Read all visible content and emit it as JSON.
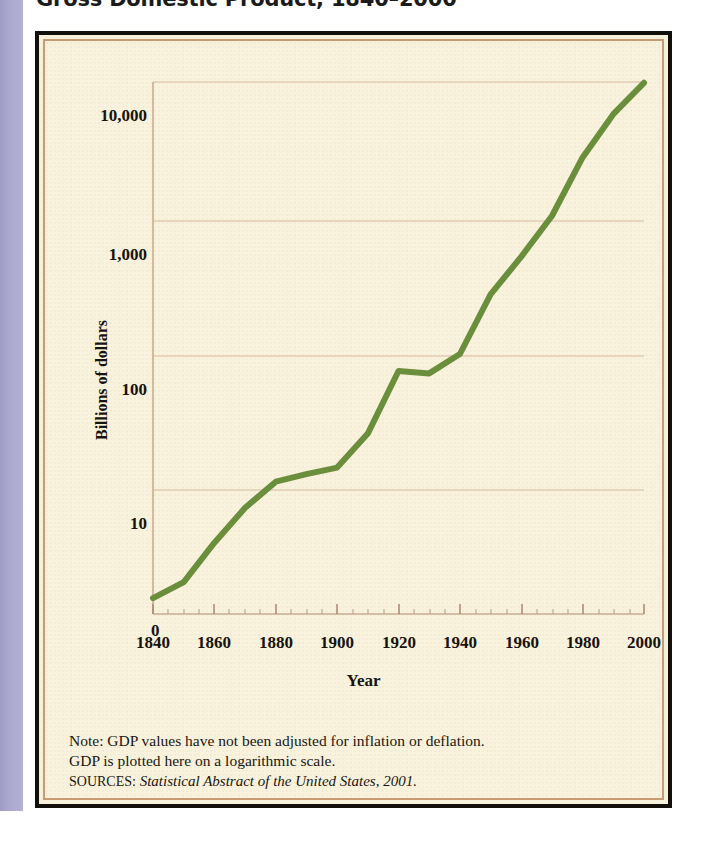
{
  "figure": {
    "title": "Gross Domestic Product, 1840–2000",
    "background_color": "#f9f2dd",
    "frame_color": "#13100c",
    "inner_border_color": "#c99b72",
    "left_strip_color": "#aaa8cc"
  },
  "notes": {
    "line1": "Note: GDP values have not been adjusted for inflation or deflation.",
    "line2": "GDP is plotted here on a logarithmic scale.",
    "source_kicker": "SOURCES:",
    "source_text": "Statistical Abstract of the United States, 2001."
  },
  "chart_data": {
    "type": "line",
    "title": "Gross Domestic Product, 1840–2000",
    "xlabel": "Year",
    "ylabel": "Billions of dollars",
    "xlim": [
      1840,
      2000
    ],
    "ylim": [
      1,
      10000
    ],
    "yscale": "log",
    "grid": true,
    "legend": null,
    "line_color": "#6b8e3d",
    "line_width": 6,
    "origin_label": "0",
    "xticks": [
      1840,
      1860,
      1880,
      1900,
      1920,
      1940,
      1960,
      1980,
      2000
    ],
    "xtick_labels": [
      "1840",
      "1860",
      "1880",
      "1900",
      "1920",
      "1940",
      "1960",
      "1980",
      "2000"
    ],
    "x_minor_tick_interval": 5,
    "yticks": [
      10,
      100,
      1000,
      10000
    ],
    "ytick_labels": [
      "10",
      "100",
      "1,000",
      "10,000"
    ],
    "x": [
      1840,
      1850,
      1860,
      1870,
      1880,
      1890,
      1900,
      1910,
      1920,
      1930,
      1940,
      1950,
      1960,
      1970,
      1980,
      1990,
      2000
    ],
    "values": [
      1.6,
      2.1,
      4.1,
      7.4,
      11.5,
      13.1,
      14.6,
      26.0,
      75.0,
      72.0,
      100.0,
      275.0,
      520.0,
      1035.0,
      2790.0,
      5800.0,
      9870.0
    ],
    "series": [
      {
        "name": "Gross Domestic Product",
        "units": "billions of dollars",
        "values": [
          1.6,
          2.1,
          4.1,
          7.4,
          11.5,
          13.1,
          14.6,
          26.0,
          75.0,
          72.0,
          100.0,
          275.0,
          520.0,
          1035.0,
          2790.0,
          5800.0,
          9870.0
        ]
      }
    ],
    "annotations": [
      "Flat plateau between 1920 and 1930 near 75 billion dollars",
      "Steep rise after 1940 on the logarithmic scale"
    ]
  }
}
